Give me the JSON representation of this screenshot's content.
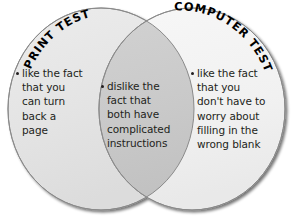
{
  "diagram": {
    "type": "venn",
    "title_left": "PRINT TEST",
    "title_right": "COMPUTER TEST",
    "background_color": "#ffffff",
    "left_circle_color": "#e5e5e5",
    "right_circle_color": "#f2f2f2",
    "overlap_color": "#c9c9c9",
    "outline_color": "#888888",
    "text_color": "#231f20"
  },
  "sets": {
    "left": {
      "label": "PRINT TEST",
      "items": [
        "like the fact that you can turn back a page"
      ]
    },
    "right": {
      "label": "COMPUTER TEST",
      "items": [
        "like the fact that you don't have to worry about filling in the wrong blank"
      ]
    },
    "intersection": {
      "items": [
        "dislike the fact that both have complicated instructions"
      ]
    }
  },
  "text_blocks": {
    "left_item": "like the fact\nthat you\ncan turn\nback a\npage",
    "center_item": "dislike the\nfact that\nboth have\ncomplicated\ninstructions",
    "right_item": "like the fact\nthat you\ndon't have to\nworry about\nfilling in the\nwrong blank"
  }
}
